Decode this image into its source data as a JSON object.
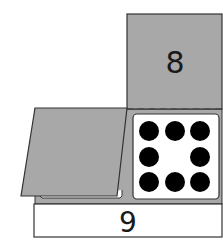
{
  "diagram": {
    "top_flap": {
      "label": "8",
      "fill": "#a8a8a8"
    },
    "bottom_strip": {
      "label": "9",
      "fill": "#ffffff"
    },
    "side_flap": {
      "fill": "#a8a8a8"
    },
    "base": {
      "fill": "#a8a8a8"
    },
    "fold_line": {
      "style": "dashed",
      "color": "#4a4a4a"
    },
    "dot_card": {
      "dot_count": 8,
      "layout": "3x3 grid without center",
      "dot_color": "#000000",
      "card_fill": "#ffffff"
    },
    "stroke_color": "#333333"
  }
}
